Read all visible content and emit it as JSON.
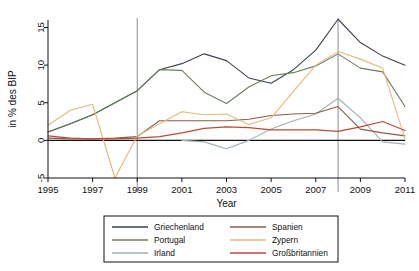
{
  "chart_data": {
    "type": "line",
    "title": "",
    "xlabel": "Year",
    "ylabel": "in % des BIP",
    "xlim": [
      1995,
      2011
    ],
    "ylim": [
      -5,
      16
    ],
    "xticks": [
      1995,
      1997,
      1999,
      2001,
      2003,
      2005,
      2007,
      2009,
      2011
    ],
    "yticks": [
      -5,
      0,
      5,
      10,
      15
    ],
    "grid": false,
    "legend_position": "bottom",
    "annotations": {
      "vertical_lines": [
        1999,
        2008
      ]
    },
    "x": [
      1995,
      1996,
      1997,
      1998,
      1999,
      2000,
      2001,
      2002,
      2003,
      2004,
      2005,
      2006,
      2007,
      2008,
      2009,
      2010,
      2011
    ],
    "series": [
      {
        "name": "Griechenland",
        "color": "#3c4450",
        "values": [
          1.1,
          2.2,
          3.4,
          5.0,
          6.6,
          9.4,
          10.2,
          11.5,
          10.6,
          8.3,
          7.6,
          9.4,
          12.0,
          16.1,
          13.0,
          11.2,
          10.0
        ]
      },
      {
        "name": "Portugal",
        "color": "#6b7f5e",
        "values": [
          1.1,
          2.2,
          3.4,
          5.0,
          6.6,
          9.4,
          9.3,
          6.4,
          4.9,
          7.1,
          8.6,
          9.0,
          9.9,
          11.5,
          9.6,
          9.1,
          4.5
        ]
      },
      {
        "name": "Irland",
        "color": "#9fb2b8",
        "values": [
          null,
          null,
          null,
          null,
          null,
          null,
          0.0,
          -0.2,
          -1.1,
          0.0,
          1.5,
          2.6,
          3.5,
          5.6,
          3.0,
          -0.2,
          -0.5
        ]
      },
      {
        "name": "Spanien",
        "color": "#8a5a4b",
        "values": [
          0.3,
          0.2,
          0.2,
          0.3,
          0.5,
          2.6,
          2.6,
          2.6,
          2.6,
          2.8,
          3.3,
          3.5,
          3.6,
          4.5,
          1.5,
          1.0,
          0.6
        ]
      },
      {
        "name": "Zypern",
        "color": "#e8b87a",
        "values": [
          2.0,
          4.0,
          4.8,
          -5.0,
          0.6,
          2.2,
          3.8,
          3.4,
          3.5,
          2.1,
          3.0,
          6.5,
          10.0,
          11.8,
          10.8,
          9.6,
          0.2
        ]
      },
      {
        "name": "Großbritannien",
        "color": "#bb4a34",
        "values": [
          0.6,
          0.3,
          0.2,
          0.2,
          0.3,
          0.5,
          1.0,
          1.6,
          1.8,
          1.7,
          1.4,
          1.4,
          1.4,
          1.2,
          1.8,
          2.5,
          1.3
        ]
      }
    ]
  },
  "legend": {
    "entries": [
      {
        "label": "Griechenland"
      },
      {
        "label": "Spanien"
      },
      {
        "label": "Portugal"
      },
      {
        "label": "Zypern"
      },
      {
        "label": "Irland"
      },
      {
        "label": "Großbritannien"
      }
    ]
  },
  "axes": {
    "x_tick_labels": [
      "1995",
      "1997",
      "1999",
      "2001",
      "2003",
      "2005",
      "2007",
      "2009",
      "2011"
    ],
    "y_tick_labels": [
      "-5",
      "0",
      "5",
      "10",
      "15"
    ],
    "x_axis_title": "Year",
    "y_axis_title": "in % des BIP"
  }
}
